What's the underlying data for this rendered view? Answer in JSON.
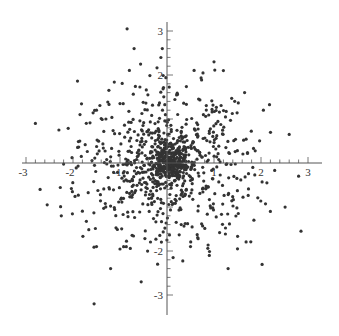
{
  "chart_data": {
    "type": "scatter",
    "title": "",
    "xlabel": "",
    "ylabel": "",
    "xlim": [
      -3.0,
      3.2
    ],
    "ylim": [
      -3.4,
      3.1
    ],
    "grid": false,
    "legend": null,
    "x_ticks": [
      -3,
      -2,
      -1,
      1,
      2,
      3
    ],
    "y_ticks": [
      3,
      2,
      -2,
      -3
    ],
    "x_tick_labels": [
      "-3",
      "-2",
      "-1",
      "1",
      "2",
      "3"
    ],
    "y_tick_labels": [
      "3",
      "2",
      "-2",
      "-3"
    ],
    "minor_ticks_per_unit": 5,
    "series": [
      {
        "name": "points",
        "description": "~1000 points, roughly 2D normal centred at origin with a dense core (|r|<0.5) and sparse outliers out to radius ~3",
        "n_points": 1000,
        "distribution": {
          "center": [
            0,
            0
          ],
          "std": 0.9,
          "core_fraction": 0.35,
          "core_std": 0.22
        },
        "outliers": [
          [
            -0.85,
            3.05
          ],
          [
            -0.7,
            2.6
          ],
          [
            -0.1,
            2.6
          ],
          [
            -2.8,
            0.9
          ],
          [
            -2.3,
            0.75
          ],
          [
            -1.5,
            1.2
          ],
          [
            -1.3,
            1.0
          ],
          [
            1.0,
            2.3
          ],
          [
            1.2,
            2.1
          ],
          [
            2.6,
            0.65
          ],
          [
            2.8,
            -0.3
          ],
          [
            2.85,
            -1.55
          ],
          [
            -2.7,
            -0.6
          ],
          [
            -2.55,
            -0.95
          ],
          [
            -2.25,
            -1.2
          ],
          [
            -1.5,
            -1.9
          ],
          [
            -1.2,
            -2.4
          ],
          [
            -0.55,
            -2.7
          ],
          [
            -1.55,
            -3.2
          ],
          [
            -0.2,
            -2.3
          ],
          [
            0.9,
            -2.1
          ],
          [
            1.3,
            -2.4
          ],
          [
            1.5,
            -1.95
          ],
          [
            0.5,
            -1.9
          ],
          [
            2.2,
            -1.1
          ],
          [
            1.85,
            -1.3
          ],
          [
            2.05,
            1.2
          ],
          [
            1.65,
            1.6
          ],
          [
            -1.85,
            1.1
          ],
          [
            -1.0,
            1.35
          ]
        ],
        "color": "#333333",
        "marker_size": 1.6
      }
    ],
    "axis_color": "#555555"
  }
}
